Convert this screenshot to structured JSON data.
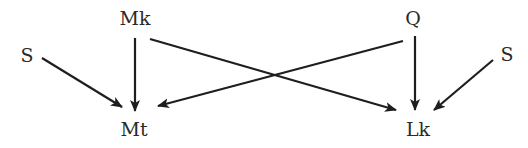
{
  "diagram": {
    "type": "directed-graph",
    "nodes": [
      {
        "id": "S1",
        "label": "S",
        "x": 27,
        "y": 55
      },
      {
        "id": "Mk",
        "label": "Mk",
        "x": 135,
        "y": 18
      },
      {
        "id": "Mt",
        "label": "Mt",
        "x": 134,
        "y": 129
      },
      {
        "id": "Q",
        "label": "Q",
        "x": 413,
        "y": 18
      },
      {
        "id": "S2",
        "label": "S",
        "x": 507,
        "y": 54
      },
      {
        "id": "Lk",
        "label": "Lk",
        "x": 418,
        "y": 129
      }
    ],
    "edges": [
      {
        "from": "S1",
        "to": "Mt"
      },
      {
        "from": "Mk",
        "to": "Mt"
      },
      {
        "from": "Mk",
        "to": "Lk"
      },
      {
        "from": "Q",
        "to": "Mt"
      },
      {
        "from": "Q",
        "to": "Lk"
      },
      {
        "from": "S2",
        "to": "Lk"
      }
    ],
    "colors": {
      "stroke": "#1e1e1e",
      "text": "#2a2a2a",
      "background": "#ffffff"
    }
  }
}
